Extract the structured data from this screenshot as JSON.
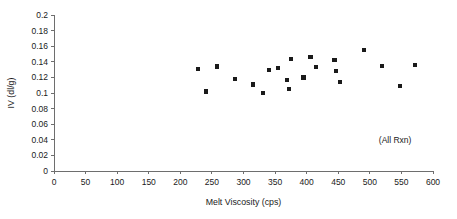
{
  "chart_data": {
    "type": "scatter",
    "title": "",
    "xlabel": "Melt Viscosity (cps)",
    "ylabel": "IV (dl/g)",
    "xlim": [
      0,
      600
    ],
    "ylim": [
      0,
      0.2
    ],
    "xticks": [
      0,
      50,
      100,
      150,
      200,
      250,
      300,
      350,
      400,
      450,
      500,
      550,
      600
    ],
    "yticks": [
      0,
      0.02,
      0.04,
      0.06,
      0.08,
      0.1,
      0.12,
      0.14,
      0.16,
      0.18,
      0.2
    ],
    "xtick_labels": [
      "0",
      "50",
      "100",
      "150",
      "200",
      "250",
      "300",
      "350",
      "400",
      "450",
      "500",
      "550",
      "600"
    ],
    "ytick_labels": [
      "0",
      "0.02",
      "0.04",
      "0.06",
      "0.08",
      "0.1",
      "0.12",
      "0.14",
      "0.16",
      "0.18",
      "0.2"
    ],
    "grid": false,
    "legend": false,
    "marker": "square",
    "marker_color": "#1a1a1a",
    "annotations": [
      {
        "text": "(All Rxn)",
        "x": 540,
        "y": 0.036
      }
    ],
    "series": [
      {
        "name": "All Rxn",
        "points": [
          {
            "x": 228,
            "y": 0.131
          },
          {
            "x": 240,
            "y": 0.102
          },
          {
            "x": 258,
            "y": 0.134
          },
          {
            "x": 286,
            "y": 0.118
          },
          {
            "x": 315,
            "y": 0.111
          },
          {
            "x": 331,
            "y": 0.1
          },
          {
            "x": 340,
            "y": 0.13
          },
          {
            "x": 354,
            "y": 0.132
          },
          {
            "x": 369,
            "y": 0.117
          },
          {
            "x": 372,
            "y": 0.105
          },
          {
            "x": 375,
            "y": 0.144
          },
          {
            "x": 395,
            "y": 0.12
          },
          {
            "x": 406,
            "y": 0.146
          },
          {
            "x": 415,
            "y": 0.133
          },
          {
            "x": 444,
            "y": 0.142
          },
          {
            "x": 446,
            "y": 0.128
          },
          {
            "x": 453,
            "y": 0.114
          },
          {
            "x": 491,
            "y": 0.155
          },
          {
            "x": 519,
            "y": 0.135
          },
          {
            "x": 548,
            "y": 0.109
          },
          {
            "x": 571,
            "y": 0.136
          }
        ]
      }
    ]
  },
  "geometry": {
    "plot_left": 54,
    "plot_right": 433,
    "plot_bottom": 171,
    "plot_top": 15
  }
}
